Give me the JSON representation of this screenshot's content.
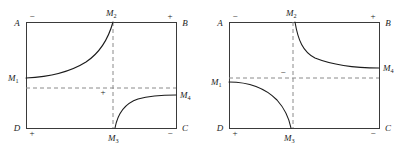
{
  "figure": {
    "name": "two-rectangle-phase-diagrams",
    "panel_count": 2,
    "stroke_colors": {
      "frame": "#3a3a3a",
      "dashed": "#8a8a8a",
      "curve": "#1b1b1b",
      "text": "#1b1b1b",
      "background": "#ffffff"
    }
  },
  "panels": [
    {
      "id": "left",
      "corners": {
        "top_left": "A",
        "top_right": "B",
        "bottom_right": "C",
        "bottom_left": "D"
      },
      "edge_signs": {
        "top_left": "−",
        "top_right": "+",
        "bottom_left": "+",
        "bottom_right": "−"
      },
      "interior_sign": "+",
      "markers": {
        "m1": {
          "label": "M",
          "sub": "1",
          "edge": "left"
        },
        "m2": {
          "label": "M",
          "sub": "2",
          "edge": "top"
        },
        "m3": {
          "label": "M",
          "sub": "3",
          "edge": "bottom"
        },
        "m4": {
          "label": "M",
          "sub": "4",
          "edge": "right"
        }
      },
      "curves": [
        {
          "name": "curve-m1-to-m2",
          "from": "M1",
          "to": "M2",
          "shape": "increasing-concave-up-asymptotic"
        },
        {
          "name": "curve-m3-to-m4",
          "from": "M3",
          "to": "M4",
          "shape": "increasing-concave-down-asymptotic"
        }
      ],
      "dashed_lines": [
        {
          "name": "vertical-asymptote-m2-m3",
          "orientation": "vertical"
        },
        {
          "name": "horizontal-asymptote-m1-m4",
          "orientation": "horizontal"
        }
      ]
    },
    {
      "id": "right",
      "corners": {
        "top_left": "A",
        "top_right": "B",
        "bottom_right": "C",
        "bottom_left": "D"
      },
      "edge_signs": {
        "top_left": "−",
        "top_right": "+",
        "bottom_left": "+",
        "bottom_right": "−"
      },
      "interior_sign": "−",
      "markers": {
        "m1": {
          "label": "M",
          "sub": "1",
          "edge": "left"
        },
        "m2": {
          "label": "M",
          "sub": "2",
          "edge": "top"
        },
        "m3": {
          "label": "M",
          "sub": "3",
          "edge": "bottom"
        },
        "m4": {
          "label": "M",
          "sub": "4",
          "edge": "right"
        }
      },
      "curves": [
        {
          "name": "curve-m2-to-m4",
          "from": "M2",
          "to": "M4",
          "shape": "decreasing-convex-asymptotic"
        },
        {
          "name": "curve-m1-to-m3",
          "from": "M1",
          "to": "M3",
          "shape": "decreasing-concave-down-asymptotic"
        }
      ],
      "dashed_lines": [
        {
          "name": "vertical-asymptote-m2-m3",
          "orientation": "vertical"
        },
        {
          "name": "horizontal-asymptote-m1-m4",
          "orientation": "horizontal"
        }
      ]
    }
  ]
}
